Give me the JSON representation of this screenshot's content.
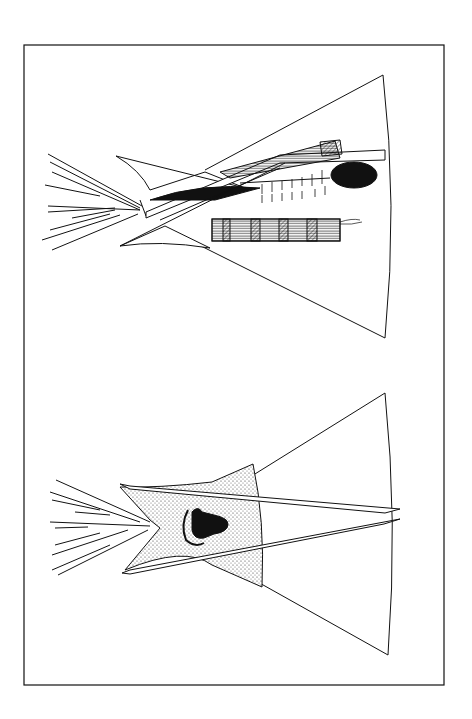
{
  "illustration": {
    "subject": "Two tipis drawn sideways (rotated 90°) in a rectangular frame",
    "colors": {
      "ink": "#111111",
      "paper": "#ffffff",
      "stipple": "#d9d9d9"
    },
    "tipis": [
      {
        "id": "upper",
        "decoration": "painted horizontal band with hatched blocks and black oval"
      },
      {
        "id": "lower",
        "decoration": "stippled door panel with black buffalo head and crescent"
      }
    ]
  }
}
